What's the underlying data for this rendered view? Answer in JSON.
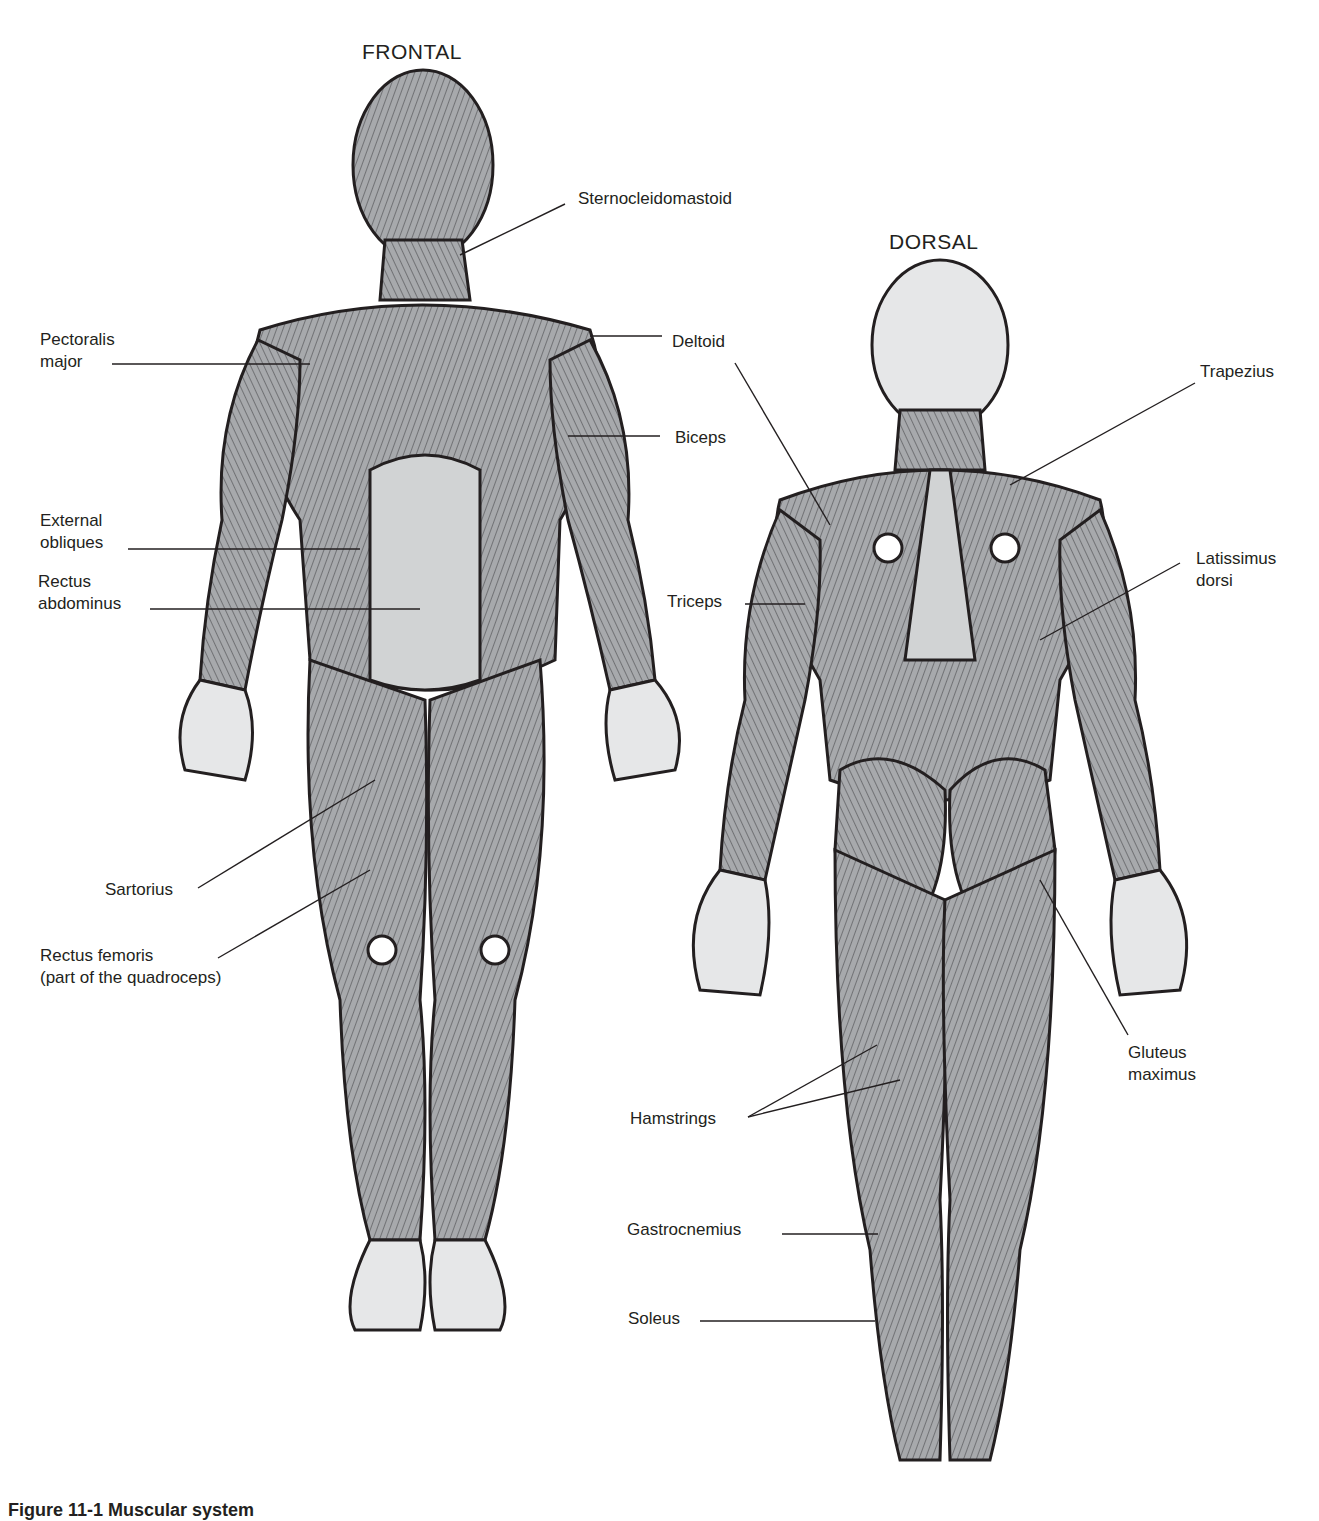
{
  "views": {
    "frontal": {
      "title": "FRONTAL"
    },
    "dorsal": {
      "title": "DORSAL"
    }
  },
  "labels": {
    "frontal": [
      {
        "id": "sternocleidomastoid",
        "text": "Sternocleidomastoid"
      },
      {
        "id": "pectoralis-major",
        "text": "Pectoralis\nmajor"
      },
      {
        "id": "deltoid",
        "text": "Deltoid"
      },
      {
        "id": "biceps",
        "text": "Biceps"
      },
      {
        "id": "external-obliques",
        "text": "External\nobliques"
      },
      {
        "id": "rectus-abdominus",
        "text": "Rectus\nabdominus"
      },
      {
        "id": "sartorius",
        "text": "Sartorius"
      },
      {
        "id": "rectus-femoris",
        "text": "Rectus femoris\n(part of the quadroceps)"
      }
    ],
    "dorsal": [
      {
        "id": "trapezius",
        "text": "Trapezius"
      },
      {
        "id": "triceps",
        "text": "Triceps"
      },
      {
        "id": "latissimus-dorsi",
        "text": "Latissimus\ndorsi"
      },
      {
        "id": "gluteus-maximus",
        "text": "Gluteus\nmaximus"
      },
      {
        "id": "hamstrings",
        "text": "Hamstrings"
      },
      {
        "id": "gastrocnemius",
        "text": "Gastrocnemius"
      },
      {
        "id": "soleus",
        "text": "Soleus"
      }
    ]
  },
  "caption": "Figure 11-1  Muscular system",
  "colors": {
    "ink": "#231f20",
    "muscle": "#a7a9ac",
    "muscle_light": "#d1d3d4",
    "skin": "#e6e7e8"
  }
}
